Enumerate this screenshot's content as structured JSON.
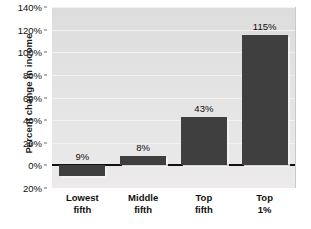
{
  "chart_data": {
    "type": "bar",
    "title": "",
    "xlabel": "",
    "ylabel": "Percent change in income",
    "categories": [
      "Lowest fifth",
      "Middle fifth",
      "Top fifth",
      "Top 1%"
    ],
    "categories_lines": [
      [
        "Lowest",
        "fifth"
      ],
      [
        "Middle",
        "fifth"
      ],
      [
        "Top",
        "fifth"
      ],
      [
        "Top",
        "1%"
      ]
    ],
    "values": [
      9,
      8,
      43,
      115
    ],
    "value_labels": [
      "9%",
      "8%",
      "43%",
      "115%"
    ],
    "bar_directions": [
      "down",
      "up",
      "up",
      "up"
    ],
    "ylim": [
      -20,
      140
    ],
    "ytick_labels": [
      "140%",
      "120%",
      "100%",
      "80%",
      "60%",
      "40%",
      "20%",
      "0%",
      "20%"
    ],
    "ytick_values": [
      140,
      120,
      100,
      80,
      60,
      40,
      20,
      0,
      -20
    ],
    "grid": true,
    "legend": "none",
    "colors": {
      "bar": "#3f3f3f",
      "plot_background": "#e3e3e3",
      "gridline": "#f2f2f0",
      "zero_line": "#111111",
      "text": "#101010"
    }
  }
}
